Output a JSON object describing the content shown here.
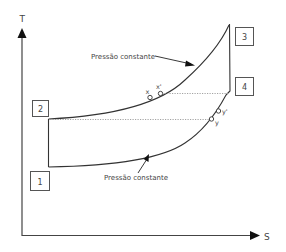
{
  "diagram": {
    "type": "T-s diagram (Brayton cycle with regeneration)",
    "axes": {
      "y_label": "T",
      "x_label": "S"
    },
    "states": [
      {
        "id": "1",
        "label": "1"
      },
      {
        "id": "2",
        "label": "2"
      },
      {
        "id": "3",
        "label": "3"
      },
      {
        "id": "4",
        "label": "4"
      }
    ],
    "points": [
      {
        "id": "x",
        "label": "x"
      },
      {
        "id": "x_prime",
        "label": "x'"
      },
      {
        "id": "y",
        "label": "y"
      },
      {
        "id": "y_prime",
        "label": "y'"
      }
    ],
    "annotations": {
      "upper_curve": "Pressão constante",
      "lower_curve": "Pressão constante"
    },
    "colors": {
      "line": "#333333",
      "dotted": "#888888",
      "text": "#444444"
    }
  }
}
